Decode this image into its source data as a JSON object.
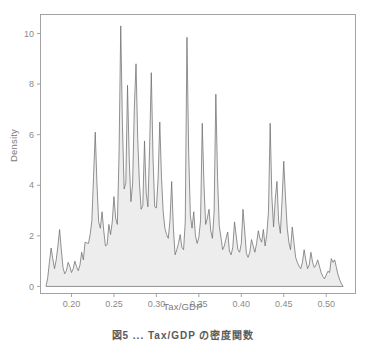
{
  "figure": {
    "caption": "図5 ... Tax/GDP の密度関数",
    "frame_color": "#9a9a9a",
    "tick_label_color": "#8a8a8a",
    "axis_title_color": "#7a7a7a",
    "curve_color": "#6e6e6e",
    "fill_color": "#ededed"
  },
  "chart_data": {
    "type": "area",
    "title": "",
    "subtitle": "",
    "xlabel": "Tax/GDP",
    "ylabel": "Density",
    "xlim": [
      0.1635,
      0.5345
    ],
    "ylim": [
      -0.28,
      10.75
    ],
    "xticks": [
      0.2,
      0.25,
      0.3,
      0.35,
      0.4,
      0.45,
      0.5
    ],
    "xticklabels": [
      "0.20",
      "0.25",
      "0.30",
      "0.35",
      "0.40",
      "0.45",
      "0.50"
    ],
    "yticks": [
      0,
      2,
      4,
      6,
      8,
      10
    ],
    "yticklabels": [
      "0",
      "2",
      "4",
      "6",
      "8",
      "10"
    ],
    "grid": false,
    "legend": null,
    "legend_position": "none",
    "series": [
      {
        "name": "Density",
        "fill": true,
        "x": [
          0.17,
          0.172,
          0.174,
          0.176,
          0.178,
          0.18,
          0.182,
          0.184,
          0.186,
          0.188,
          0.19,
          0.192,
          0.194,
          0.196,
          0.198,
          0.2,
          0.202,
          0.204,
          0.206,
          0.208,
          0.21,
          0.212,
          0.214,
          0.216,
          0.218,
          0.22,
          0.222,
          0.224,
          0.226,
          0.228,
          0.23,
          0.232,
          0.234,
          0.236,
          0.238,
          0.24,
          0.242,
          0.244,
          0.246,
          0.248,
          0.25,
          0.252,
          0.254,
          0.256,
          0.258,
          0.26,
          0.262,
          0.264,
          0.266,
          0.268,
          0.27,
          0.272,
          0.274,
          0.276,
          0.278,
          0.28,
          0.282,
          0.284,
          0.286,
          0.288,
          0.29,
          0.292,
          0.294,
          0.296,
          0.298,
          0.3,
          0.302,
          0.304,
          0.306,
          0.308,
          0.31,
          0.312,
          0.314,
          0.316,
          0.318,
          0.32,
          0.322,
          0.324,
          0.326,
          0.328,
          0.33,
          0.332,
          0.334,
          0.336,
          0.338,
          0.34,
          0.342,
          0.344,
          0.346,
          0.348,
          0.35,
          0.352,
          0.354,
          0.356,
          0.358,
          0.36,
          0.362,
          0.364,
          0.366,
          0.368,
          0.37,
          0.372,
          0.374,
          0.376,
          0.378,
          0.38,
          0.382,
          0.384,
          0.386,
          0.388,
          0.39,
          0.392,
          0.394,
          0.396,
          0.398,
          0.4,
          0.402,
          0.404,
          0.406,
          0.408,
          0.41,
          0.412,
          0.414,
          0.416,
          0.418,
          0.42,
          0.422,
          0.424,
          0.426,
          0.428,
          0.43,
          0.432,
          0.434,
          0.436,
          0.438,
          0.44,
          0.442,
          0.444,
          0.446,
          0.448,
          0.45,
          0.452,
          0.454,
          0.456,
          0.458,
          0.46,
          0.462,
          0.464,
          0.466,
          0.468,
          0.47,
          0.472,
          0.474,
          0.476,
          0.478,
          0.48,
          0.482,
          0.484,
          0.486,
          0.488,
          0.49,
          0.492,
          0.494,
          0.496,
          0.498,
          0.5,
          0.502,
          0.504,
          0.506,
          0.508,
          0.51,
          0.512,
          0.514,
          0.516,
          0.518,
          0.52
        ],
        "values": [
          0.0,
          0.35,
          0.95,
          1.52,
          1.1,
          0.7,
          1.05,
          1.6,
          2.25,
          1.45,
          0.75,
          0.5,
          0.62,
          0.95,
          0.8,
          0.55,
          0.7,
          1.0,
          0.78,
          0.62,
          0.85,
          1.35,
          1.05,
          1.75,
          1.72,
          1.7,
          2.05,
          2.6,
          4.35,
          6.1,
          4.05,
          2.55,
          2.3,
          2.95,
          2.2,
          1.6,
          1.65,
          2.45,
          2.05,
          2.55,
          3.55,
          2.7,
          2.45,
          5.2,
          10.3,
          6.4,
          3.85,
          4.1,
          7.95,
          5.05,
          3.35,
          4.05,
          7.05,
          8.8,
          5.85,
          4.1,
          3.05,
          3.2,
          5.75,
          3.7,
          3.15,
          5.45,
          8.45,
          5.1,
          3.15,
          3.1,
          4.25,
          6.5,
          4.3,
          2.95,
          2.3,
          2.05,
          1.9,
          2.6,
          4.15,
          2.3,
          1.25,
          1.45,
          1.7,
          2.05,
          1.55,
          1.45,
          2.55,
          9.85,
          5.3,
          2.8,
          2.3,
          2.95,
          2.0,
          1.7,
          1.95,
          2.6,
          6.45,
          4.05,
          2.45,
          2.7,
          3.05,
          2.2,
          1.9,
          2.95,
          7.6,
          4.35,
          2.4,
          1.95,
          1.45,
          1.6,
          1.9,
          2.15,
          1.4,
          1.25,
          1.55,
          2.55,
          2.0,
          1.45,
          1.35,
          1.7,
          3.05,
          2.2,
          1.3,
          1.15,
          1.35,
          1.85,
          1.6,
          1.35,
          1.7,
          2.2,
          1.9,
          1.75,
          2.25,
          1.6,
          2.05,
          2.95,
          6.45,
          3.55,
          2.35,
          3.45,
          4.15,
          2.55,
          2.1,
          3.4,
          4.95,
          3.55,
          2.35,
          1.75,
          1.45,
          2.35,
          1.75,
          1.15,
          0.95,
          0.8,
          0.7,
          0.95,
          1.45,
          1.05,
          0.7,
          0.85,
          1.35,
          0.95,
          0.75,
          0.85,
          1.05,
          0.8,
          0.55,
          0.4,
          0.3,
          0.45,
          0.6,
          0.55,
          1.1,
          0.95,
          1.05,
          0.75,
          0.45,
          0.25,
          0.1,
          0.0
        ]
      }
    ]
  }
}
